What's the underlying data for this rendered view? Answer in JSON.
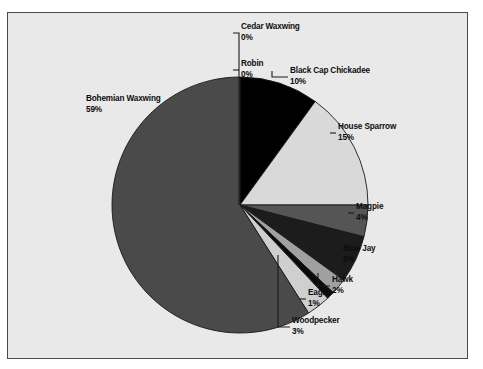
{
  "chart_data": {
    "type": "pie",
    "title": "",
    "subtitle": "",
    "xlabel": "",
    "ylabel": "",
    "legend_position": "none",
    "labels_show_percent": true,
    "start_angle_deg": 0,
    "direction": "clockwise",
    "categories": [
      "Cedar Waxwing",
      "Robin",
      "Black Cap Chickadee",
      "House Sparrow",
      "Magpie",
      "Blue Jay",
      "Hawk",
      "Eagle",
      "Woodpecker",
      "Bohemian Waxwing"
    ],
    "values": [
      0,
      0,
      10,
      15,
      4,
      6,
      2,
      1,
      3,
      59
    ],
    "value_labels": [
      "0%",
      "0%",
      "10%",
      "15%",
      "4%",
      "6%",
      "2%",
      "1%",
      "3%",
      "59%"
    ],
    "colors": [
      "#b8b8b8",
      "#8f8f8f",
      "#000000",
      "#d9d9d9",
      "#555555",
      "#1c1c1c",
      "#a0a0a0",
      "#0a0a0a",
      "#cfcfcf",
      "#4a4a4a"
    ],
    "slice_outline_color": "#1a1a1a",
    "background_color": "#e9e9e9",
    "frame_border_color": "#4a4a4a",
    "text_color": "#0d0d0d"
  },
  "labels": {
    "cedar_waxwing": {
      "name": "Cedar Waxwing",
      "pct": "0%"
    },
    "robin": {
      "name": "Robin",
      "pct": "0%"
    },
    "black_cap_chickadee": {
      "name": "Black Cap Chickadee",
      "pct": "10%"
    },
    "house_sparrow": {
      "name": "House Sparrow",
      "pct": "15%"
    },
    "magpie": {
      "name": "Magpie",
      "pct": "4%"
    },
    "blue_jay": {
      "name": "Blue Jay",
      "pct": "6%"
    },
    "hawk": {
      "name": "Hawk",
      "pct": "2%"
    },
    "eagle": {
      "name": "Eagle",
      "pct": "1%"
    },
    "woodpecker": {
      "name": "Woodpecker",
      "pct": "3%"
    },
    "bohemian_waxwing": {
      "name": "Bohemian Waxwing",
      "pct": "59%"
    }
  }
}
